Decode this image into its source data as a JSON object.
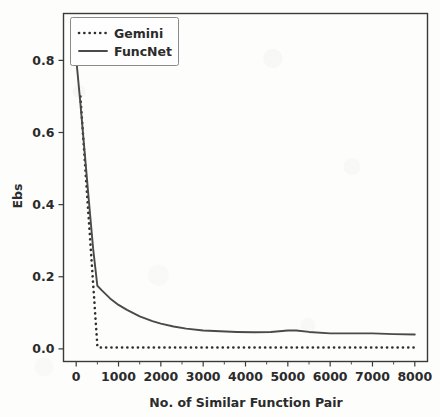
{
  "figure": {
    "background_color": "#fdfdfc",
    "axes_color": "#3a3a3a"
  },
  "chart_data": {
    "type": "line",
    "title": "",
    "xlabel": "No. of Similar Function Pair",
    "ylabel": "Ebs",
    "xlim": [
      -300,
      8300
    ],
    "ylim": [
      -0.035,
      0.93
    ],
    "xticks": [
      0,
      1000,
      2000,
      3000,
      4000,
      5000,
      6000,
      7000,
      8000
    ],
    "xticklabels": [
      "0",
      "1000",
      "2000",
      "3000",
      "4000",
      "5000",
      "6000",
      "7000",
      "8000"
    ],
    "yticks": [
      0.0,
      0.2,
      0.4,
      0.6,
      0.8
    ],
    "yticklabels": [
      "0.0",
      "0.2",
      "0.4",
      "0.6",
      "0.8"
    ],
    "grid": false,
    "legend_position": "upper left",
    "series": [
      {
        "name": "Gemini",
        "style": "dotted",
        "color": "#2e2e2e",
        "x": [
          100,
          500,
          520,
          1000,
          2000,
          3000,
          4000,
          5000,
          6000,
          7000,
          8000
        ],
        "values": [
          0.7,
          0.008,
          0.004,
          0.004,
          0.004,
          0.004,
          0.004,
          0.004,
          0.004,
          0.004,
          0.004
        ]
      },
      {
        "name": "FuncNet",
        "style": "solid",
        "color": "#4a4a4a",
        "x": [
          0,
          100,
          200,
          300,
          400,
          500,
          600,
          800,
          1000,
          1200,
          1500,
          1800,
          2000,
          2300,
          2600,
          3000,
          3400,
          3800,
          4200,
          4600,
          5000,
          5200,
          5500,
          6000,
          6500,
          7000,
          7500,
          8000
        ],
        "values": [
          0.805,
          0.68,
          0.545,
          0.41,
          0.278,
          0.175,
          0.163,
          0.14,
          0.122,
          0.108,
          0.09,
          0.077,
          0.07,
          0.062,
          0.056,
          0.051,
          0.049,
          0.047,
          0.046,
          0.047,
          0.051,
          0.051,
          0.047,
          0.043,
          0.043,
          0.043,
          0.041,
          0.04
        ]
      }
    ]
  },
  "legend": {
    "entries": [
      {
        "label": "Gemini",
        "style": "dotted"
      },
      {
        "label": "FuncNet",
        "style": "solid"
      }
    ]
  }
}
